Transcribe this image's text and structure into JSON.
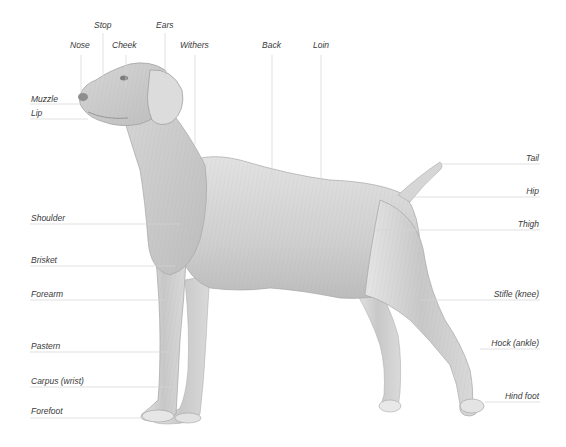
{
  "diagram": {
    "colors": {
      "label_text": "#3a3a3a",
      "leader_line": "#d4d4d4",
      "background": "#ffffff",
      "sketch_mid": "#bdbdbd",
      "sketch_dark": "#8a8a8a"
    },
    "labels_top": [
      {
        "id": "nose",
        "text": "Nose"
      },
      {
        "id": "stop",
        "text": "Stop"
      },
      {
        "id": "cheek",
        "text": "Cheek"
      },
      {
        "id": "ears",
        "text": "Ears"
      },
      {
        "id": "withers",
        "text": "Withers"
      },
      {
        "id": "back",
        "text": "Back"
      },
      {
        "id": "loin",
        "text": "Loin"
      }
    ],
    "labels_left": [
      {
        "id": "muzzle",
        "text": "Muzzle"
      },
      {
        "id": "lip",
        "text": "Lip"
      },
      {
        "id": "shoulder",
        "text": "Shoulder"
      },
      {
        "id": "brisket",
        "text": "Brisket"
      },
      {
        "id": "forearm",
        "text": "Forearm"
      },
      {
        "id": "pastern",
        "text": "Pastern"
      },
      {
        "id": "carpus",
        "text": "Carpus (wrist)"
      },
      {
        "id": "forefoot",
        "text": "Forefoot"
      }
    ],
    "labels_right": [
      {
        "id": "tail",
        "text": "Tail"
      },
      {
        "id": "hip",
        "text": "Hip"
      },
      {
        "id": "thigh",
        "text": "Thigh"
      },
      {
        "id": "stifle",
        "text": "Stifle (knee)"
      },
      {
        "id": "hock",
        "text": "Hock (ankle)"
      },
      {
        "id": "hind_foot",
        "text": "Hind foot"
      }
    ]
  }
}
